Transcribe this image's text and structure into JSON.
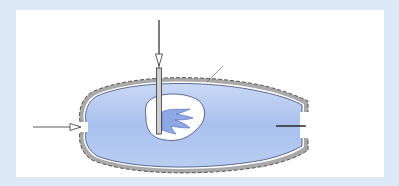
{
  "diagram": {
    "fuel": {
      "formula_main": "C",
      "sub1": "8",
      "formula_mid": "H",
      "sub2": "18",
      "phase": "(l)",
      "conditions": "25°C, 1 atm"
    },
    "insulation_label": "Insulation",
    "air": {
      "label": "Air",
      "conditions": "25°C, 1 atm"
    },
    "products": {
      "label": "Combustion products,",
      "temp_symbol": "T",
      "temp_sub": "P"
    },
    "colors": {
      "frame": "#dde9f6",
      "chamber_fill": "#a9c1ee",
      "insulation": "#a9a9a9",
      "panel": "#ffffff"
    }
  }
}
